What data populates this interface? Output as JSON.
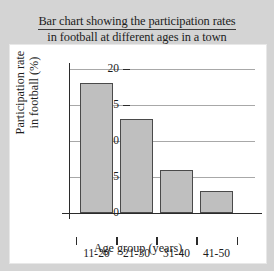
{
  "chart_data": {
    "type": "bar",
    "title": "Bar chart showing the participation rates in football at different ages in a town",
    "title_lines": [
      "Bar chart showing the participation rates",
      "in football at different ages in a town"
    ],
    "categories": [
      "11-20",
      "21-30",
      "31-40",
      "41-50"
    ],
    "values": [
      18,
      13,
      6,
      3
    ],
    "xlabel": "Age group (years)",
    "ylabel": "Participation rate in football (%)",
    "ylabel_lines": [
      "Participation rate",
      "in football (%)"
    ],
    "ylim": [
      0,
      20
    ],
    "ytick_labels": [
      "0",
      "5",
      "10",
      "15",
      "20"
    ],
    "ytick_values": [
      0,
      5,
      10,
      15,
      20
    ],
    "grid": true,
    "legend": false,
    "bar_fill_color": "#bfbfbf",
    "bar_edge_color": "#4a4a4a",
    "axis_color": "#2b2b2b",
    "gridline_color": "#a8a8a8",
    "panel_color": "#ffffff",
    "page_background": "#d4d4d4"
  }
}
